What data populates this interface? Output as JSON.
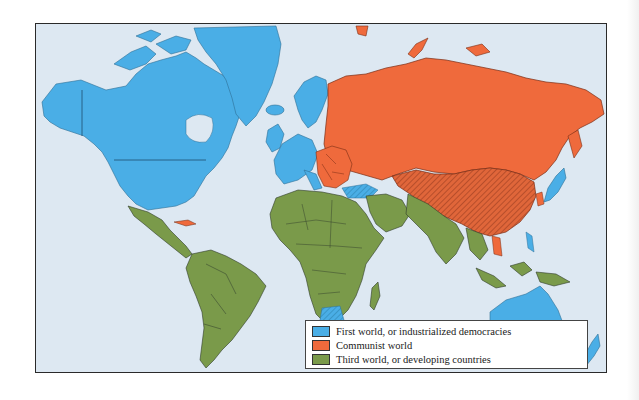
{
  "map": {
    "type": "world political map (Cold War three-worlds classification)",
    "colors": {
      "ocean": "#dde8f2",
      "first_world": "#4aaee6",
      "communist_world": "#ef6a3c",
      "third_world": "#7a9a4a",
      "border": "#2f3a2a"
    }
  },
  "legend": {
    "items": [
      {
        "label": "First world, or industrialized democracies",
        "color": "#4aaee6"
      },
      {
        "label": "Communist world",
        "color": "#ef6a3c"
      },
      {
        "label": "Third world, or developing countries",
        "color": "#7a9a4a"
      }
    ]
  }
}
